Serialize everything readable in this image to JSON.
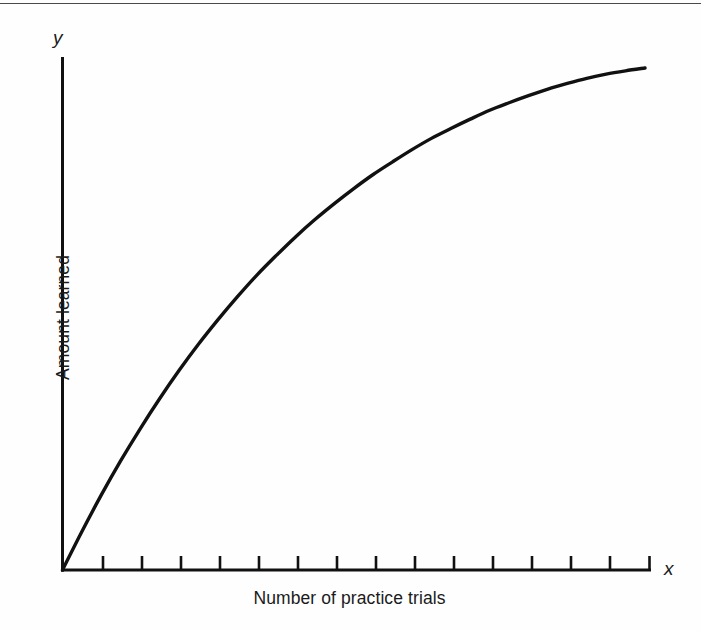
{
  "chart_data": {
    "type": "line",
    "title": "",
    "xlabel": "Number of practice trials",
    "ylabel": "Amount learned",
    "x_axis_variable": "x",
    "y_axis_variable": "y",
    "grid": false,
    "legend": null,
    "axis_tick_labels": [],
    "x_tick_count": 15,
    "xlim": [
      0,
      15
    ],
    "ylim": [
      0,
      1
    ],
    "series": [
      {
        "name": "Learning curve",
        "color": "#111111",
        "x": [
          0,
          0.5,
          1,
          1.5,
          2,
          2.5,
          3,
          3.5,
          4,
          4.5,
          5,
          5.5,
          6,
          6.5,
          7,
          7.5,
          8,
          8.5,
          9,
          9.5,
          10,
          10.5,
          11,
          11.5,
          12,
          12.5,
          13,
          13.5,
          14,
          14.5,
          15
        ],
        "y": [
          0.0,
          0.082,
          0.16,
          0.233,
          0.301,
          0.365,
          0.425,
          0.481,
          0.533,
          0.582,
          0.628,
          0.67,
          0.71,
          0.747,
          0.781,
          0.813,
          0.843,
          0.87,
          0.896,
          0.92,
          0.941,
          0.961,
          0.98,
          0.996,
          1.011,
          1.025,
          1.037,
          1.048,
          1.057,
          1.064,
          1.07
        ]
      }
    ]
  },
  "figure": {
    "x_axis_title": "Number of practice trials",
    "y_axis_title": "Amount learned",
    "x_variable": "x",
    "y_variable": "y"
  }
}
